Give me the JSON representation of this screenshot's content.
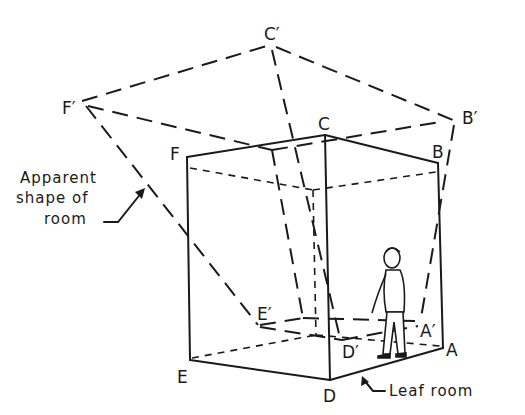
{
  "figure": {
    "vertex_labels": {
      "A": "A",
      "B": "B",
      "C": "C",
      "D": "D",
      "E": "E",
      "F": "F",
      "A_prime": "A′",
      "B_prime": "B′",
      "C_prime": "C′",
      "D_prime": "D′",
      "E_prime": "E′",
      "F_prime": "F′"
    },
    "annotations": {
      "apparent_line1": "Apparent",
      "apparent_line2": "shape of",
      "apparent_line3": "room",
      "leaf_room": "Leaf room"
    },
    "colors": {
      "ink": "#1a1a1a",
      "background": "#ffffff"
    }
  }
}
